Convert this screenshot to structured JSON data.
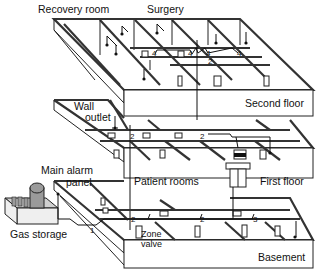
{
  "diagram": {
    "type": "cutaway building schematic",
    "labels": {
      "recovery_room": "Recovery room",
      "surgery": "Surgery",
      "second_floor": "Second floor",
      "wall_outlet": "Wall outlet",
      "wall_outlet_line1": "Wall",
      "wall_outlet_line2": "outlet",
      "patient_rooms": "Patient rooms",
      "first_floor": "First floor",
      "main_alarm_panel_line1": "Main alarm",
      "main_alarm_panel_line2": "panel",
      "gas_storage": "Gas storage",
      "zone_valve_line1": "Zone",
      "zone_valve_line2": "valve",
      "basement": "Basement"
    },
    "pipe_markers": {
      "m1": "1",
      "m2a": "2",
      "m2b": "2",
      "m2c": "2",
      "m2d": "2",
      "m3": "3",
      "m4a": "4",
      "m4b": "4",
      "m4c": "4",
      "m4d": "4",
      "m2_second": "2"
    },
    "floors": [
      "Second floor",
      "First floor",
      "Basement"
    ],
    "colors": {
      "line": "#222222",
      "background": "#ffffff",
      "storage_gray": "#9a9a9a"
    }
  }
}
